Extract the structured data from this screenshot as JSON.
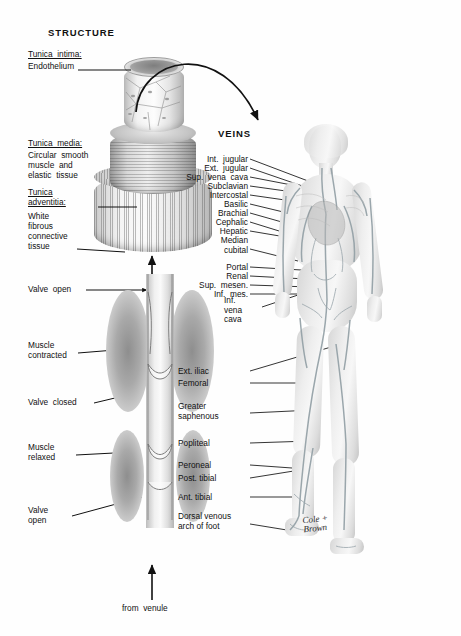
{
  "figure": {
    "headings": {
      "structure": "STRUCTURE",
      "veins": "VEINS"
    },
    "signature": "Cole +\nBrown"
  },
  "structure_labels": [
    {
      "id": "tunica-intima",
      "title": "Tunica  intima:",
      "lines": [
        "Endothelium"
      ]
    },
    {
      "id": "tunica-media",
      "title": "Tunica  media:",
      "lines": [
        "Circular  smooth",
        "muscle  and",
        "elastic  tissue"
      ]
    },
    {
      "id": "tunica-adventitia",
      "title": "Tunica\nadventitia:",
      "lines": [
        "White",
        "fibrous",
        "connective",
        "tissue"
      ]
    }
  ],
  "valve_labels": [
    {
      "id": "valve-open-top",
      "text": "Valve  open"
    },
    {
      "id": "muscle-contracted",
      "text": "Muscle\ncontracted"
    },
    {
      "id": "valve-closed",
      "text": "Valve  closed"
    },
    {
      "id": "muscle-relaxed",
      "text": "Muscle\nrelaxed"
    },
    {
      "id": "valve-open-bottom",
      "text": "Valve\nopen"
    },
    {
      "id": "from-venule",
      "text": "from  venule"
    }
  ],
  "vein_labels": [
    {
      "id": "int-jugular",
      "text": "Int.  jugular"
    },
    {
      "id": "ext-jugular",
      "text": "Ext.  jugular"
    },
    {
      "id": "sup-vena-cava",
      "text": "Sup.  vena  cava"
    },
    {
      "id": "subclavian",
      "text": "Subclavian"
    },
    {
      "id": "intercostal",
      "text": "Intercostal"
    },
    {
      "id": "basilic",
      "text": "Basilic"
    },
    {
      "id": "brachial",
      "text": "Brachial"
    },
    {
      "id": "cephalic",
      "text": "Cephalic"
    },
    {
      "id": "hepatic",
      "text": "Hepatic"
    },
    {
      "id": "median-cubital",
      "text": "Median\n   cubital"
    },
    {
      "id": "portal",
      "text": "Portal"
    },
    {
      "id": "renal",
      "text": "Renal"
    },
    {
      "id": "sup-mesen",
      "text": "Sup.  mesen."
    },
    {
      "id": "inf-mes",
      "text": "Inf.  mes."
    },
    {
      "id": "inf-vena-cava",
      "text": "Inf.\nvena\ncava"
    },
    {
      "id": "ext-iliac",
      "text": "Ext. iliac"
    },
    {
      "id": "femoral",
      "text": "Femoral"
    },
    {
      "id": "greater-saphenous",
      "text": "Greater\nsaphenous"
    },
    {
      "id": "popliteal",
      "text": "Popliteal"
    },
    {
      "id": "peroneal",
      "text": "Peroneal"
    },
    {
      "id": "post-tibial",
      "text": "Post. tibial"
    },
    {
      "id": "ant-tibial",
      "text": "Ant. tibial"
    },
    {
      "id": "dorsal-venous-arch",
      "text": "Dorsal  venous\narch  of  foot"
    }
  ],
  "colors": {
    "ink": "#1a1a1a",
    "paper": "#fefefe",
    "vein": "#9aa3a6"
  }
}
